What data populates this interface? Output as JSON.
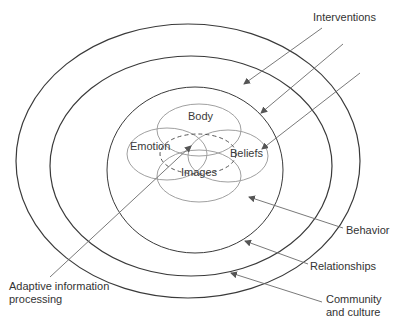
{
  "diagram": {
    "type": "concentric-ellipses",
    "rings": [
      {
        "id": "community",
        "label": "Community\nand culture"
      },
      {
        "id": "relationships",
        "label": "Relationships"
      },
      {
        "id": "behavior",
        "label": "Behavior"
      }
    ],
    "core_circles": [
      "Body",
      "Emotion",
      "Beliefs",
      "Images"
    ],
    "labels": {
      "interventions": "Interventions",
      "behavior": "Behavior",
      "relationships": "Relationships",
      "community_line1": "Community",
      "community_line2": "and culture",
      "aip_line1": "Adaptive information",
      "aip_line2": "processing",
      "body": "Body",
      "emotion": "Emotion",
      "beliefs": "Beliefs",
      "images": "Images"
    },
    "colors": {
      "ring_stroke": "#3a3a3a",
      "core_stroke": "#9a9a9a",
      "arrow_stroke": "#6a6a6a",
      "text": "#333333"
    }
  }
}
